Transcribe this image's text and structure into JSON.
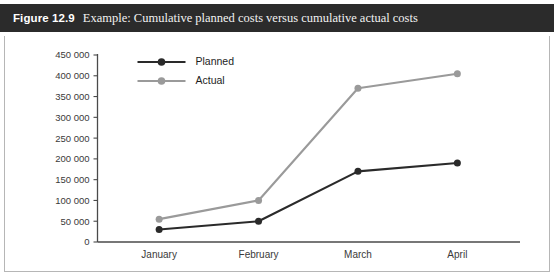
{
  "figure": {
    "label": "Figure 12.9",
    "caption": "Example: Cumulative planned costs versus cumulative actual costs"
  },
  "colors": {
    "header_background": "#2b2b2b",
    "header_text": "#ffffff",
    "panel_background": "#ffffff",
    "panel_border": "#b6b6b6",
    "axis": "#4a4a4a",
    "planned": "#2a2a2a",
    "actual": "#9a9a9a"
  },
  "chart_data": {
    "type": "line",
    "title": "Example: Cumulative planned costs versus cumulative actual costs",
    "xlabel": "",
    "ylabel": "",
    "categories": [
      "January",
      "February",
      "March",
      "April"
    ],
    "series": [
      {
        "name": "Planned",
        "color": "#2a2a2a",
        "values": [
          30000,
          50000,
          170000,
          190000
        ]
      },
      {
        "name": "Actual",
        "color": "#9a9a9a",
        "values": [
          55000,
          100000,
          370000,
          405000
        ]
      }
    ],
    "ylim": [
      0,
      450000
    ],
    "ytick_step": 50000,
    "ytick_labels": [
      "0",
      "50 000",
      "100 000",
      "150 000",
      "200 000",
      "250 000",
      "300 000",
      "350 000",
      "400 000",
      "450 000"
    ],
    "ytick_values": [
      0,
      50000,
      100000,
      150000,
      200000,
      250000,
      300000,
      350000,
      400000,
      450000
    ],
    "grid": false,
    "legend_position": "top-left",
    "markers": "circle"
  }
}
